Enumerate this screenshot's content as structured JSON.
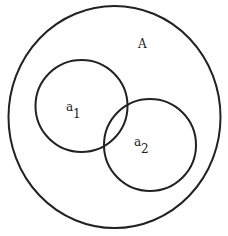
{
  "diagram": {
    "type": "venn",
    "background": "#ffffff",
    "stroke_color": "#222222",
    "stroke_width": 2,
    "universe": {
      "label": "A",
      "cx": 114.5,
      "cy": 117,
      "rx": 106,
      "ry": 111,
      "label_x": 138,
      "label_y": 48
    },
    "sets": [
      {
        "name": "a1",
        "label_main": "a",
        "label_sub": "1",
        "cx": 81.5,
        "cy": 106,
        "r": 46,
        "label_x": 66,
        "label_y": 111,
        "sub_x": 73,
        "sub_y": 118
      },
      {
        "name": "a2",
        "label_main": "a",
        "label_sub": "2",
        "cx": 150,
        "cy": 145,
        "r": 46,
        "label_x": 134,
        "label_y": 146,
        "sub_x": 141,
        "sub_y": 153
      }
    ]
  }
}
